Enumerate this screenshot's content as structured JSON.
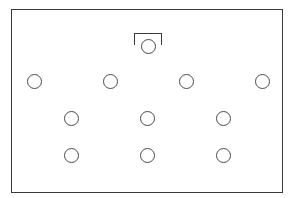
{
  "diagram": {
    "type": "formation",
    "formation": "4-3-3",
    "line_color": "#3a3a3a",
    "goal": {
      "left": 134,
      "top": 33,
      "width": 28,
      "height": 12
    },
    "goalkeeper": {
      "x": 148,
      "y": 46
    },
    "rows": [
      {
        "name": "row-1",
        "players": [
          {
            "x": 34,
            "y": 81
          },
          {
            "x": 110,
            "y": 81
          },
          {
            "x": 186,
            "y": 81
          },
          {
            "x": 262,
            "y": 81
          }
        ]
      },
      {
        "name": "row-2",
        "players": [
          {
            "x": 71,
            "y": 118
          },
          {
            "x": 147,
            "y": 118
          },
          {
            "x": 223,
            "y": 118
          }
        ]
      },
      {
        "name": "row-3",
        "players": [
          {
            "x": 71,
            "y": 155
          },
          {
            "x": 147,
            "y": 155
          },
          {
            "x": 223,
            "y": 155
          }
        ]
      }
    ]
  }
}
